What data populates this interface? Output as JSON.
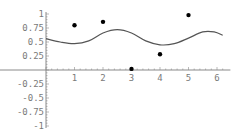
{
  "chart_data": {
    "type": "scatter",
    "title": "",
    "xlabel": "",
    "ylabel": "",
    "xlim": [
      0,
      6.4
    ],
    "ylim": [
      -1,
      1
    ],
    "grid": false,
    "legend": null,
    "x_ticks": [
      "1",
      "2",
      "3",
      "4",
      "5",
      "6"
    ],
    "y_ticks": [
      "1",
      "0.75",
      "0.5",
      "0.25",
      "-0.25",
      "-0.5",
      "-0.75",
      "-1"
    ],
    "series": [
      {
        "name": "points",
        "kind": "scatter",
        "x": [
          1,
          2,
          3,
          4,
          5
        ],
        "y": [
          0.8,
          0.86,
          0.02,
          0.28,
          0.98
        ]
      },
      {
        "name": "fit-curve",
        "kind": "line",
        "x": [
          0,
          0.5,
          1.0,
          1.5,
          2.0,
          2.5,
          3.0,
          3.5,
          4.0,
          4.5,
          5.0,
          5.5,
          5.9,
          6.2
        ],
        "y": [
          0.56,
          0.5,
          0.47,
          0.52,
          0.66,
          0.72,
          0.66,
          0.52,
          0.45,
          0.47,
          0.57,
          0.68,
          0.68,
          0.62
        ]
      }
    ]
  },
  "colors": {
    "axis": "#8a8a8a",
    "tick_label": "#7a7a7a",
    "curve": "#555555",
    "point": "#000000"
  }
}
